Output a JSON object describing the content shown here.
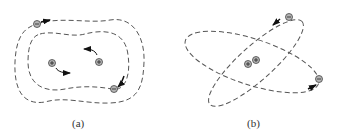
{
  "figure": {
    "panels": [
      {
        "label": "(a)",
        "description": "Two positive nuclei with a shared electron cloud: two dashed closed orbits enclosing both nuclei",
        "nuclei": [
          {
            "sign": "+"
          },
          {
            "sign": "+"
          }
        ],
        "electrons": [
          {
            "sign": "-"
          },
          {
            "sign": "-"
          }
        ]
      },
      {
        "label": "(b)",
        "description": "Two adjacent positive nuclei with two crossing elliptical dashed orbits",
        "nuclei": [
          {
            "sign": "+"
          },
          {
            "sign": "+"
          }
        ],
        "electrons": [
          {
            "sign": "-"
          },
          {
            "sign": "-"
          }
        ]
      }
    ],
    "colors": {
      "line": "#555555",
      "particle_fill": "#b5b5b5",
      "particle_stroke": "#444444",
      "arrow": "#111111"
    }
  }
}
